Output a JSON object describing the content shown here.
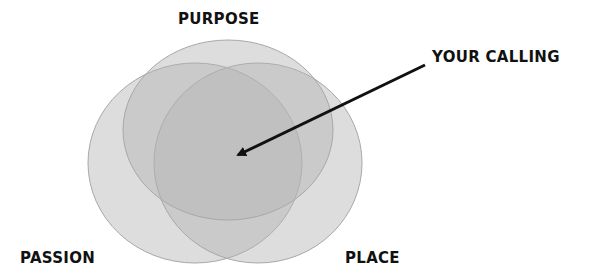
{
  "diagram": {
    "type": "venn",
    "sets": [
      {
        "id": "purpose",
        "label": "PURPOSE",
        "cx": 228,
        "cy": 130,
        "rx": 105,
        "ry": 90
      },
      {
        "id": "passion",
        "label": "PASSION",
        "cx": 195,
        "cy": 163,
        "rx": 107,
        "ry": 100
      },
      {
        "id": "place",
        "label": "PLACE",
        "cx": 258,
        "cy": 163,
        "rx": 104,
        "ry": 100
      }
    ],
    "intersection_label": "YOUR CALLING",
    "colors": {
      "fill": "#b0b0b0",
      "fill_opacity": 0.45,
      "stroke": "#a8a8a8",
      "arrow": "#111111",
      "text": "#111111",
      "background": "#ffffff"
    },
    "arrow": {
      "from": [
        425,
        65
      ],
      "to": [
        235,
        156
      ]
    }
  }
}
